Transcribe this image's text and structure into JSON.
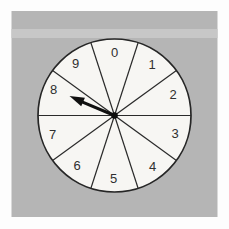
{
  "figure": {
    "type": "spinner-diagram",
    "sector_count": 10,
    "labels": [
      "0",
      "1",
      "2",
      "3",
      "4",
      "5",
      "6",
      "7",
      "8",
      "9"
    ],
    "arrow": {
      "points_to_label": "8",
      "angle_deg_clockwise_from_top": 293
    }
  },
  "colors": {
    "page_background": "#fdfdfd",
    "panel": "#b5b5b5",
    "panel_band": "#c7c7c7",
    "wheel_face": "#f7f6f3",
    "outline": "#262626",
    "digit": "#2f2f2f",
    "arrow": "#101010"
  }
}
